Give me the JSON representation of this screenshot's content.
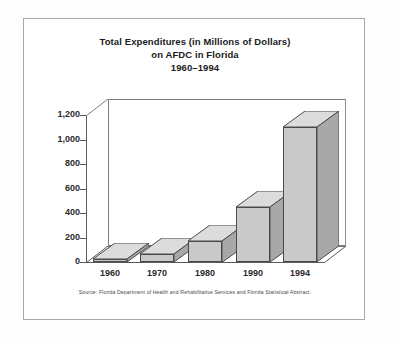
{
  "chart_data": {
    "type": "bar",
    "title": "Total Expenditures (in Millions of Dollars) on AFDC in Florida 1960–1994",
    "title_lines": [
      "Total Expenditures (in Millions of Dollars)",
      "on AFDC in Florida",
      "1960–1994"
    ],
    "categories": [
      "1960",
      "1970",
      "1980",
      "1990",
      "1994"
    ],
    "values": [
      12,
      65,
      175,
      450,
      1100
    ],
    "xlabel": "",
    "ylabel": "",
    "ylim": [
      0,
      1200
    ],
    "ytick_values": [
      0,
      200,
      400,
      600,
      800,
      1000,
      1200
    ],
    "ytick_labels": [
      "0",
      "200",
      "400",
      "600",
      "800",
      "1,000",
      "1,200"
    ],
    "grid": false,
    "legend": false,
    "style": "3d-column",
    "source_note": "Source: Florida Department of Health and Rehabilitative Services and Florida Statistical Abstract.",
    "colors": {
      "bar_front": "#c9c9c9",
      "bar_top": "#dcdcdc",
      "bar_side": "#a8a8a8",
      "bar_outline": "#4a4a4a",
      "axis": "#5a5a5a",
      "text": "#2a2a2a",
      "frame": "#a9a9a9",
      "background": "#ffffff"
    }
  }
}
